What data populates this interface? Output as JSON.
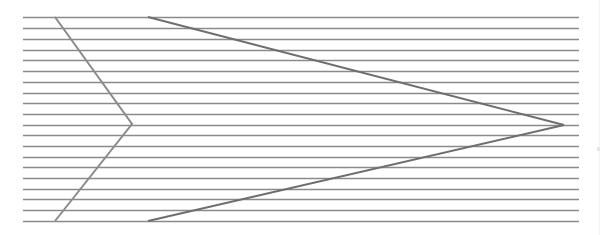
{
  "figure": {
    "type": "parallel-lines-illusion",
    "width": 601,
    "height": 235
  },
  "horizontal_lines": {
    "count": 20,
    "x_start": 23,
    "x_end": 579,
    "y_positions": [
      17,
      28,
      39,
      50,
      60,
      71,
      82,
      93,
      103,
      114,
      125,
      135,
      146,
      157,
      167,
      178,
      189,
      199,
      210,
      221
    ],
    "color": "#8a8a8a",
    "stroke_width": 1.3
  },
  "chevrons": [
    {
      "name": "left-chevron",
      "points": [
        [
          55,
          17
        ],
        [
          132,
          124
        ],
        [
          55,
          221
        ]
      ],
      "color": "#8a8a8a",
      "stroke_width": 2
    },
    {
      "name": "right-arrow-chevron",
      "points": [
        [
          148,
          17
        ],
        [
          564,
          125
        ],
        [
          148,
          221
        ]
      ],
      "color": "#6e6e6e",
      "stroke_width": 2
    }
  ],
  "colors": {
    "background": "#ffffff",
    "lines": "#8a8a8a",
    "chevron_dark": "#6e6e6e"
  }
}
